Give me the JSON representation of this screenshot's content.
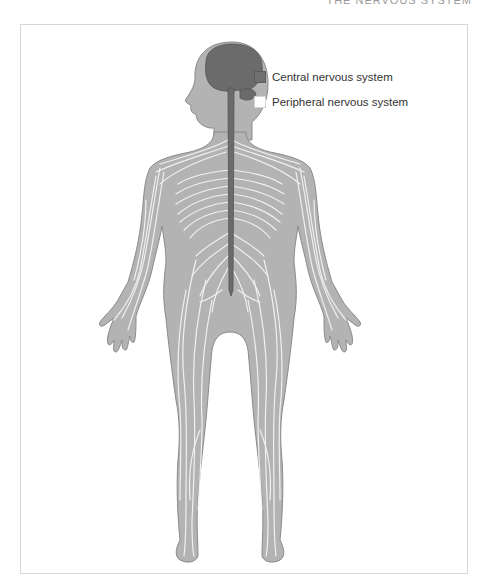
{
  "header": {
    "title": "THE NERVOUS SYSTEM"
  },
  "legend": {
    "items": [
      {
        "label": "Central nervous system",
        "swatch": "filled-dark-gray",
        "color": "#6f6f6f"
      },
      {
        "label": "Peripheral nervous system",
        "swatch": "outlined-white",
        "color": "#ffffff"
      }
    ]
  },
  "colors": {
    "body": "#b3b3b3",
    "body_outline": "#8a8a8a",
    "cns": "#6b6b6b",
    "pns": "#f4f4f4",
    "frame": "#d6d6d6"
  }
}
